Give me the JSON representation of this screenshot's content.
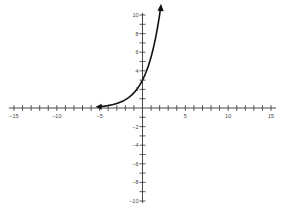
{
  "chart_data": {
    "type": "line",
    "title": "",
    "xlabel": "",
    "ylabel": "",
    "xlim": [
      -15,
      15
    ],
    "ylim": [
      -10,
      10
    ],
    "grid": false,
    "x_ticks_labeled": [
      -15,
      -10,
      -5,
      5,
      10,
      15
    ],
    "y_ticks_labeled": [
      10,
      8,
      6,
      4,
      2,
      -2,
      -4,
      -6,
      -8,
      -10
    ],
    "x_minor_step": 1,
    "y_minor_step": 1,
    "series": [
      {
        "name": "exponential curve",
        "function": "y = 3 * 1.83^x",
        "x": [
          -5,
          -4,
          -3,
          -2,
          -1,
          0,
          1,
          2,
          2.1
        ],
        "values": [
          0.15,
          0.27,
          0.49,
          0.9,
          1.64,
          3.0,
          5.49,
          10.0,
          10.6
        ],
        "arrows": [
          "left",
          "right"
        ],
        "color": "#111111"
      }
    ],
    "horizontal_asymptote": 0,
    "y_intercept": 3
  },
  "colors": {
    "axis": "#333333",
    "curve": "#111111",
    "background": "#ffffff"
  }
}
